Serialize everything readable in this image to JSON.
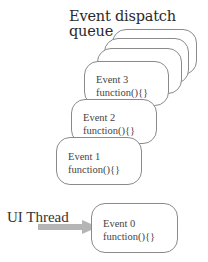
{
  "diagram": {
    "title_line1": "Event dispatch",
    "title_line2": "queue",
    "queue_events": [
      {
        "name": "Event 3",
        "code": "function(){}"
      },
      {
        "name": "Event 2",
        "code": "function(){}"
      },
      {
        "name": "Event 1",
        "code": "function(){}"
      }
    ],
    "hidden_queue_cards": 3,
    "thread_label": "UI Thread",
    "current_event": {
      "name": "Event 0",
      "code": "function(){}"
    },
    "arrow_color": "#b0b0b0",
    "border_color": "#8a8a8a"
  }
}
